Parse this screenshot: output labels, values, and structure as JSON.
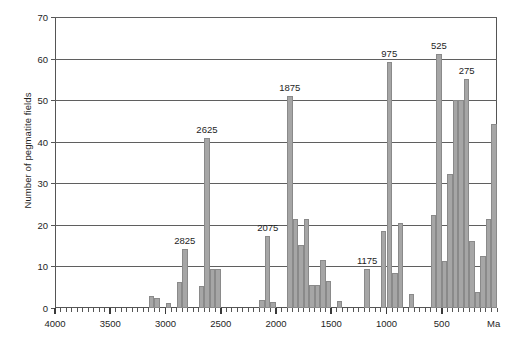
{
  "chart_data": {
    "type": "bar",
    "title": "",
    "xlabel": "Ma",
    "ylabel": "Number of pegmatite fields",
    "xlim": [
      4000,
      0
    ],
    "ylim": [
      0,
      70
    ],
    "x_axis_reversed": true,
    "bin_width_ma": 50,
    "grid": "horizontal",
    "legend": "none",
    "y_ticks": [
      0,
      10,
      20,
      30,
      40,
      50,
      60,
      70
    ],
    "x_major_ticks": [
      4000,
      3500,
      3000,
      2500,
      2000,
      1500,
      1000,
      500
    ],
    "x_major_tick_labels": [
      "4000",
      "3500",
      "3000",
      "2500",
      "2000",
      "1500",
      "1000",
      "500"
    ],
    "x_minor_tick_step": 50,
    "unit_label": "Ma",
    "bar_color": "#a6a6a6",
    "bar_edge_color": "#8a8a8a",
    "axis_color": "#555555",
    "grid_color": "#5f5f5f",
    "text_color": "#1e1e1e",
    "bars": [
      {
        "x": 3125,
        "value": 3
      },
      {
        "x": 3075,
        "value": 2.3
      },
      {
        "x": 2975,
        "value": 1.3
      },
      {
        "x": 2875,
        "value": 6.3
      },
      {
        "x": 2825,
        "value": 14.2
      },
      {
        "x": 2675,
        "value": 5.3
      },
      {
        "x": 2625,
        "value": 41
      },
      {
        "x": 2575,
        "value": 9.4
      },
      {
        "x": 2525,
        "value": 9.4
      },
      {
        "x": 2125,
        "value": 2
      },
      {
        "x": 2075,
        "value": 17.4
      },
      {
        "x": 2025,
        "value": 1.4
      },
      {
        "x": 1875,
        "value": 51
      },
      {
        "x": 1825,
        "value": 21.3
      },
      {
        "x": 1775,
        "value": 15.2
      },
      {
        "x": 1725,
        "value": 21.3
      },
      {
        "x": 1675,
        "value": 5.6
      },
      {
        "x": 1625,
        "value": 5.6
      },
      {
        "x": 1575,
        "value": 11.6
      },
      {
        "x": 1525,
        "value": 6.6
      },
      {
        "x": 1425,
        "value": 1.6
      },
      {
        "x": 1175,
        "value": 9.4
      },
      {
        "x": 1025,
        "value": 18.5
      },
      {
        "x": 975,
        "value": 59.2
      },
      {
        "x": 925,
        "value": 8.5
      },
      {
        "x": 875,
        "value": 20.5
      },
      {
        "x": 775,
        "value": 3.4
      },
      {
        "x": 575,
        "value": 22.3
      },
      {
        "x": 525,
        "value": 61.2
      },
      {
        "x": 475,
        "value": 11.4
      },
      {
        "x": 425,
        "value": 32.3
      },
      {
        "x": 375,
        "value": 50
      },
      {
        "x": 325,
        "value": 50
      },
      {
        "x": 275,
        "value": 55
      },
      {
        "x": 225,
        "value": 16.2
      },
      {
        "x": 175,
        "value": 3.8
      },
      {
        "x": 125,
        "value": 12.5
      },
      {
        "x": 75,
        "value": 21.3
      },
      {
        "x": 25,
        "value": 44.3
      }
    ],
    "annotations": [
      {
        "label": "2825",
        "x": 2825,
        "value": 14.2
      },
      {
        "label": "2625",
        "x": 2625,
        "value": 41
      },
      {
        "label": "2075",
        "x": 2075,
        "value": 17.4
      },
      {
        "label": "1875",
        "x": 1875,
        "value": 51
      },
      {
        "label": "1175",
        "x": 1175,
        "value": 9.4
      },
      {
        "label": "975",
        "x": 975,
        "value": 59.2
      },
      {
        "label": "525",
        "x": 525,
        "value": 61.2
      },
      {
        "label": "275",
        "x": 275,
        "value": 55
      }
    ]
  }
}
